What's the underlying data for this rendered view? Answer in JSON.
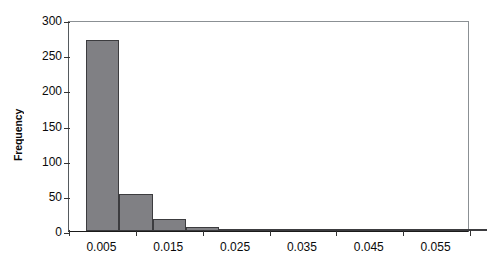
{
  "chart_data": {
    "type": "bar",
    "title": "",
    "subtitle": "",
    "xlabel": "",
    "ylabel": "Frequency",
    "categories": [
      "0.005",
      "0.010",
      "0.015",
      "0.020",
      "0.025",
      "0.030",
      "0.035",
      "0.040",
      "0.045",
      "0.050",
      "0.055",
      "0.060"
    ],
    "bin_centers": [
      0.005,
      0.01,
      0.015,
      0.02,
      0.025,
      0.03,
      0.035,
      0.04,
      0.045,
      0.05,
      0.055,
      0.06
    ],
    "values": [
      271,
      52,
      17,
      5,
      2,
      3,
      0,
      1,
      1,
      0,
      1,
      0
    ],
    "series": [
      {
        "name": "Frequency",
        "values": [
          271,
          52,
          17,
          5,
          2,
          3,
          0,
          1,
          1,
          0,
          1,
          0
        ]
      }
    ],
    "xlim": [
      0.0,
      0.06
    ],
    "ylim": [
      0,
      300
    ],
    "bin_width": 0.005,
    "y_ticks": [
      0,
      50,
      100,
      150,
      200,
      250,
      300
    ],
    "y_tick_labels": [
      "0",
      "50",
      "100",
      "150",
      "200",
      "250",
      "300"
    ],
    "x_ticks": [
      0.0,
      0.01,
      0.02,
      0.03,
      0.04,
      0.05,
      0.06
    ],
    "x_tick_labels": [
      "0.005",
      "0.015",
      "0.025",
      "0.035",
      "0.045",
      "0.055"
    ],
    "x_tick_label_positions": [
      0.005,
      0.015,
      0.025,
      0.035,
      0.045,
      0.055
    ],
    "grid": false,
    "legend": false,
    "legend_position": "none",
    "colors": {
      "bar_fill": "#808084",
      "bar_border": "#3c3c3f",
      "axis": "#1a1a1a",
      "text": "#0a0a0a",
      "background": "#ffffff",
      "frame_light": "#8b9094"
    }
  }
}
